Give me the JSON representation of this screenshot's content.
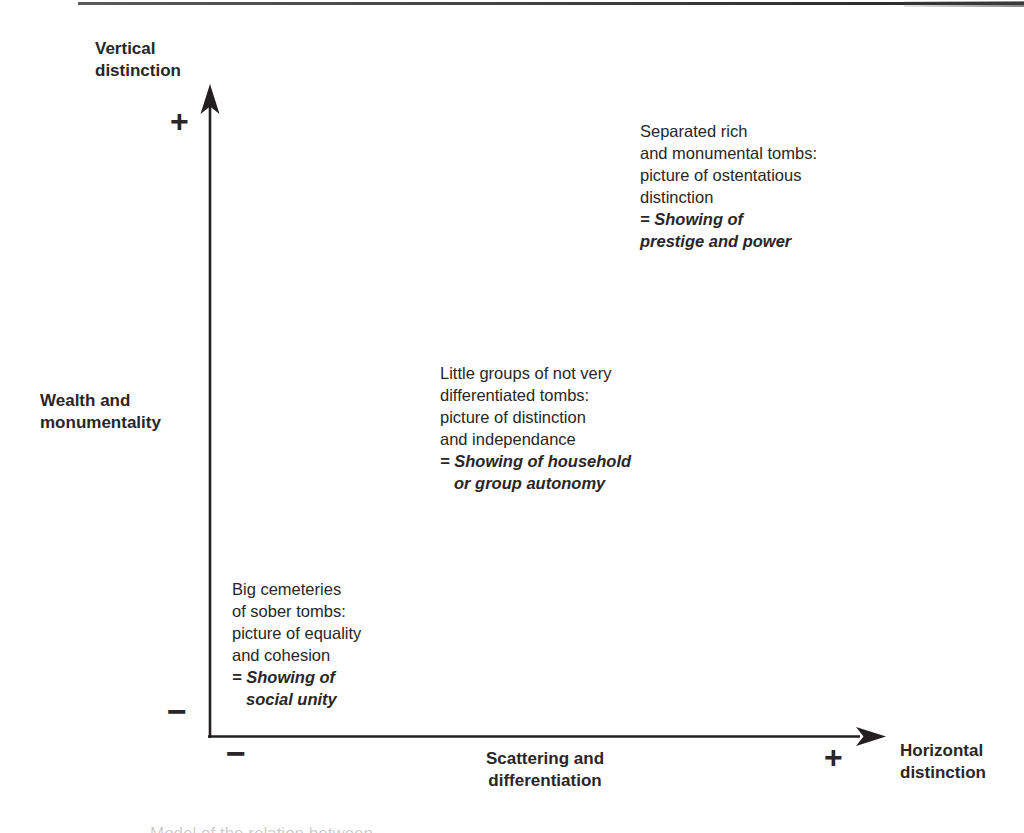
{
  "colors": {
    "ink": "#2a2627",
    "background": "#ffffff"
  },
  "diagram": {
    "vertical_axis": {
      "title_line1": "Vertical",
      "title_line2": "distinction",
      "plus": "+",
      "minus": "−",
      "side_label_line1": "Wealth and",
      "side_label_line2": "monumentality"
    },
    "horizontal_axis": {
      "title_line1": "Horizontal",
      "title_line2": "distinction",
      "plus": "+",
      "minus": "−",
      "center_label_line1": "Scattering and",
      "center_label_line2": "differentiation"
    },
    "notes": {
      "high": {
        "line1": "Separated rich",
        "line2": "and monumental tombs:",
        "line3": "picture of ostentatious",
        "line4": "distinction",
        "em1": "= Showing of",
        "em2": "prestige and power"
      },
      "mid": {
        "line1": "Little groups of not very",
        "line2": "differentiated tombs:",
        "line3": "picture of distinction",
        "line4": "and independance",
        "em1": "= Showing of household",
        "em2": "or group autonomy"
      },
      "low": {
        "line1": "Big cemeteries",
        "line2": "of sober tombs:",
        "line3": "picture of equality",
        "line4": "and cohesion",
        "em1": "= Showing of",
        "em2": "social unity"
      }
    },
    "cropped_caption": "Model of the relation between"
  }
}
